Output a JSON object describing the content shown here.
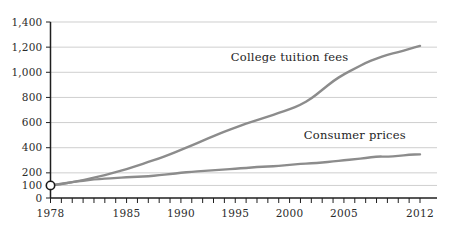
{
  "chart_data": {
    "type": "line",
    "title": "",
    "subtitle": "",
    "xlabel": "",
    "ylabel": "",
    "xlim": [
      1978,
      2012
    ],
    "ylim": [
      0,
      1400
    ],
    "grid": true,
    "legend_position": "inline-annotations",
    "note": "Index, 1978 = 100",
    "x": [
      1978,
      1979,
      1980,
      1981,
      1982,
      1983,
      1984,
      1985,
      1986,
      1987,
      1988,
      1989,
      1990,
      1991,
      1992,
      1993,
      1994,
      1995,
      1996,
      1997,
      1998,
      1999,
      2000,
      2001,
      2002,
      2003,
      2004,
      2005,
      2006,
      2007,
      2008,
      2009,
      2010,
      2011,
      2012
    ],
    "y_ticks": [
      0,
      100,
      200,
      400,
      600,
      800,
      1000,
      1200,
      1400
    ],
    "y_tick_labels": [
      "0",
      "100",
      "200",
      "400",
      "600",
      "800",
      "1,000",
      "1,200",
      "1,400"
    ],
    "x_ticks": [
      1978,
      1979,
      1980,
      1981,
      1982,
      1983,
      1984,
      1985,
      1986,
      1987,
      1988,
      1989,
      1990,
      1991,
      1992,
      1993,
      1994,
      1995,
      1996,
      1997,
      1998,
      1999,
      2000,
      2001,
      2002,
      2003,
      2004,
      2005,
      2006,
      2007,
      2008,
      2009,
      2010,
      2011,
      2012
    ],
    "x_tick_labels": [
      {
        "value": 1978,
        "label": "1978"
      },
      {
        "value": 1985,
        "label": "1985"
      },
      {
        "value": 1990,
        "label": "1990"
      },
      {
        "value": 1995,
        "label": "1995"
      },
      {
        "value": 2000,
        "label": "2000"
      },
      {
        "value": 2005,
        "label": "2005"
      },
      {
        "value": 2012,
        "label": "2012"
      }
    ],
    "series": [
      {
        "name": "College tuition fees",
        "color": "#8c8c8c",
        "label_x": 2000,
        "label_y": 1090,
        "values": [
          100,
          112,
          126,
          143,
          162,
          183,
          206,
          230,
          258,
          286,
          315,
          348,
          383,
          418,
          455,
          492,
          528,
          560,
          592,
          620,
          648,
          676,
          706,
          740,
          790,
          860,
          930,
          985,
          1030,
          1075,
          1110,
          1140,
          1160,
          1185,
          1210
        ]
      },
      {
        "name": "Consumer prices",
        "color": "#8c8c8c",
        "label_x": 2006,
        "label_y": 470,
        "values": [
          100,
          111,
          126,
          139,
          148,
          153,
          159,
          165,
          168,
          174,
          181,
          190,
          200,
          209,
          215,
          221,
          227,
          233,
          240,
          246,
          250,
          255,
          264,
          271,
          276,
          282,
          290,
          300,
          309,
          318,
          330,
          329,
          334,
          345,
          347
        ]
      }
    ],
    "origin_marker": {
      "x": 1978,
      "y": 100,
      "shape": "circle-hollow"
    }
  },
  "colors": {
    "grid": "#b9b9b9",
    "axis": "#1f1f1f",
    "line": "#8c8c8c",
    "text": "#2b2b2b",
    "background": "#ffffff"
  }
}
